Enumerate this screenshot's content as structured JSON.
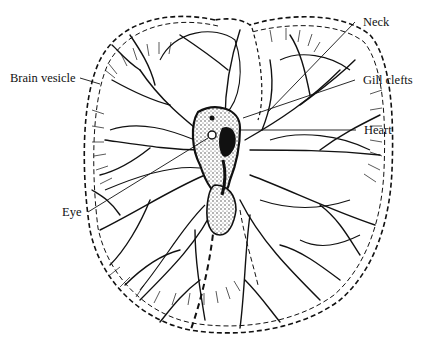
{
  "figure": {
    "labels": {
      "brain_vesicle": "Brain vesicle",
      "neck": "Neck",
      "gill_clefts": "Gill clefts",
      "heart": "Heart",
      "eye": "Eye"
    },
    "colors": {
      "ink": "#111111",
      "background": "#ffffff",
      "stipple": "#333333"
    }
  }
}
